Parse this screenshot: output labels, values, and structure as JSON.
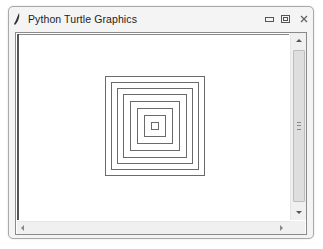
{
  "window": {
    "title": "Python Turtle Graphics",
    "controls": {
      "minimize": "minimize-icon",
      "maximize": "maximize-icon",
      "close": "close-icon"
    }
  },
  "canvas": {
    "background": "#ffffff",
    "line_color": "#6a6a6a",
    "squares": [
      {
        "size": 100
      },
      {
        "size": 88
      },
      {
        "size": 76
      },
      {
        "size": 64
      },
      {
        "size": 50
      },
      {
        "size": 36
      },
      {
        "size": 22
      },
      {
        "size": 8
      }
    ]
  },
  "scrollbars": {
    "vertical": {
      "up": "scroll-up-arrow",
      "down": "scroll-down-arrow"
    },
    "horizontal": {
      "left": "scroll-left-arrow",
      "right": "scroll-right-arrow"
    }
  }
}
